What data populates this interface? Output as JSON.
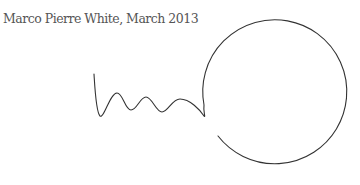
{
  "caption": "Marco Pierre White, March 2013",
  "drawing": {
    "description": "Hand-drawn squiggle line leading into an open circle",
    "stroke_color": "#333333",
    "background_color": "#ffffff"
  }
}
